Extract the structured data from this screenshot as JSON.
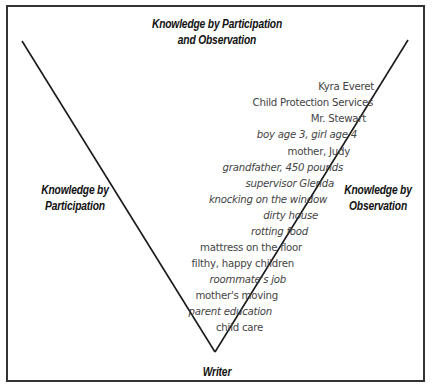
{
  "diagram": {
    "headings": {
      "top": "Knowledge by Participation and Observation",
      "top_line1": "Knowledge by Participation",
      "top_line2": "and Observation",
      "left_line1": "Knowledge by",
      "left_line2": "Participation",
      "right_line1": "Knowledge by",
      "right_line2": "Observation",
      "bottom": "Writer"
    },
    "items": [
      "Kyra Everet",
      "Child Protection Services",
      "Mr. Stewart",
      "boy age 3, girl age 4",
      "mother, Judy",
      "grandfather, 450 pounds",
      "supervisor Glenda",
      "knocking on the window",
      "dirty house",
      "rotting food",
      "mattress on the floor",
      "filthy, happy children",
      "roommate's job",
      "mother's moving",
      "parent education",
      "child care"
    ],
    "colors": {
      "line": "#1a1a1a",
      "border": "#333333",
      "heading_text": "#111111",
      "item_text": "#444444"
    }
  }
}
